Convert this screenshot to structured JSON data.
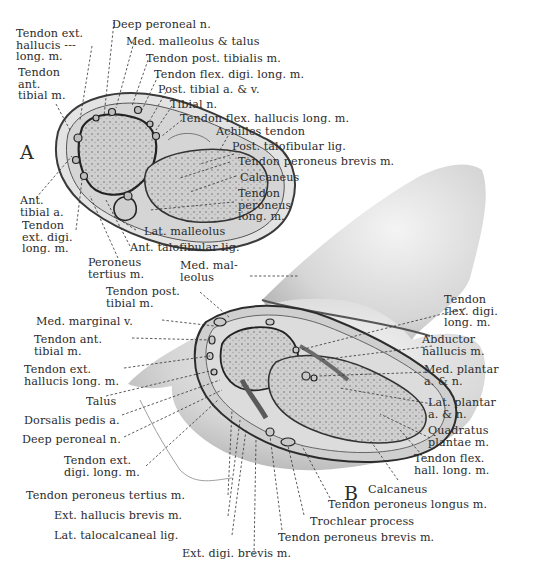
{
  "figure": {
    "panel_a_letter": "A",
    "panel_b_letter": "B",
    "colors": {
      "background": "#ffffff",
      "ink": "#2b2b2b",
      "skin": "#d9d9d9",
      "bone": "#b9b9b9",
      "shadow": "#8a8a8a"
    }
  },
  "panel_a": {
    "labels": {
      "tendon_ext_hallucis_long": "Tendon ext.\nhallucis ---\nlong. m.",
      "tendon_ant_tibial": "Tendon\nant.\ntibial m.",
      "deep_peroneal_n": "Deep peroneal n.",
      "med_malleolus_talus": "Med. malleolus & talus",
      "tendon_post_tibialis": "Tendon post. tibialis m.",
      "tendon_flex_digi_long": "Tendon flex. digi. long. m.",
      "post_tibial_av": "Post. tibial a. & v.",
      "tibial_n": "Tibial n.",
      "tendon_flex_hallucis_long": "Tendon flex. hallucis long. m.",
      "achilles_tendon": "Achilles tendon",
      "post_talofibular_lig": "Post. talofibular lig.",
      "tendon_peroneus_brevis": "Tendon peroneus brevis m.",
      "calcaneus": "Calcaneus",
      "tendon_peroneus_long": "Tendon\nperoneus\nlong. m.",
      "ant_tibial_a": "Ant.\ntibial a.",
      "tendon_ext_digi_long": "Tendon\next. digi.\nlong. m.",
      "lat_malleolus": "Lat. malleolus",
      "ant_talofibular_lig": "Ant. talofibular lig.",
      "peroneus_tertius": "Peroneus\ntertius m.",
      "med_malleolus": "Med. mal-\nleolus"
    }
  },
  "panel_b": {
    "labels": {
      "tendon_post_tibial": "Tendon post.\ntibial m.",
      "med_marginal_v": "Med. marginal v.",
      "tendon_ant_tibial": "Tendon ant.\ntibial m.",
      "tendon_ext_hallucis_long": "Tendon ext.\nhallucis long. m.",
      "talus": "Talus",
      "dorsalis_pedis_a": "Dorsalis pedis a.",
      "deep_peroneal_n": "Deep peroneal n.",
      "tendon_ext_digi_long": "Tendon ext.\ndigi. long. m.",
      "tendon_peroneus_tertius": "Tendon peroneus tertius m.",
      "ext_hallucis_brevis": "Ext. hallucis brevis m.",
      "lat_talocalcaneal_lig": "Lat. talocalcaneal lig.",
      "ext_digi_brevis": "Ext. digi. brevis m.",
      "tendon_flex_digi_long": "Tendon\nflex. digi.\nlong. m.",
      "abductor_hallucis": "Abductor\nhallucis m.",
      "med_plantar_an": "Med. plantar\na. & n.",
      "lat_plantar_an": "Lat. plantar\na. & n.",
      "quadratus_plantae": "Quadratus\nplantae m.",
      "tendon_flex_hall_long": "Tendon flex.\nhall. long. m.",
      "calcaneus": "Calcaneus",
      "tendon_peroneus_longus": "Tendon peroneus longus m.",
      "trochlear_process": "Trochlear process",
      "tendon_peroneus_brevis": "Tendon peroneus brevis m."
    }
  }
}
